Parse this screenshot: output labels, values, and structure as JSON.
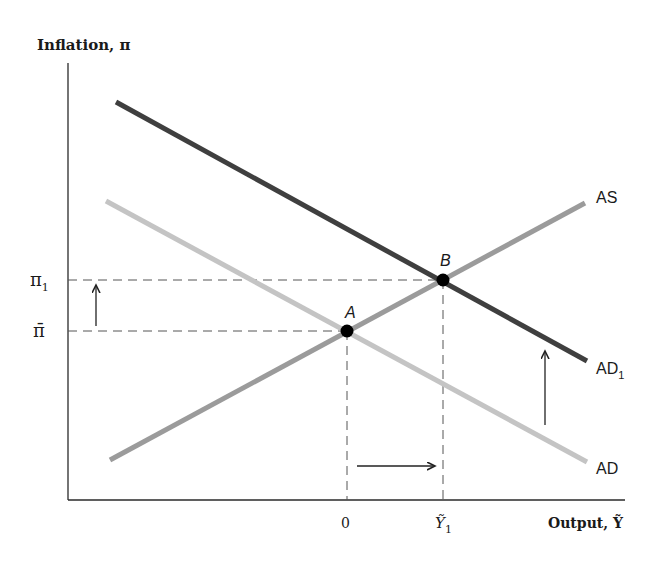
{
  "diagram": {
    "y_axis_label": "Inflation, π",
    "x_axis_label": "Output, Ỹ",
    "y_ticks": [
      {
        "label": "π",
        "sub": "1",
        "y": 280
      },
      {
        "label": "π̄",
        "sub": "",
        "y": 331
      }
    ],
    "x_ticks": [
      {
        "label": "0",
        "sub": "",
        "x": 347
      },
      {
        "label": "Ỹ",
        "sub": "1",
        "x": 443
      }
    ],
    "curves": [
      {
        "id": "AD1",
        "label": "AD",
        "sub": "1",
        "color": "#3f3f3f",
        "x1": 116,
        "y1": 102,
        "x2": 587,
        "y2": 361
      },
      {
        "id": "AD",
        "label": "AD",
        "sub": "",
        "color": "#c4c4c4",
        "x1": 106,
        "y1": 201,
        "x2": 587,
        "y2": 462
      },
      {
        "id": "AS",
        "label": "AS",
        "sub": "",
        "color": "#9b9b9b",
        "x1": 110,
        "y1": 460,
        "x2": 585,
        "y2": 203
      }
    ],
    "points": [
      {
        "label": "A",
        "x": 347,
        "y": 331
      },
      {
        "label": "B",
        "x": 443,
        "y": 280
      }
    ],
    "arrows": [
      {
        "name": "inflation-rise-arrow",
        "direction": "up",
        "x1": 96,
        "y1": 326,
        "x2": 96,
        "y2": 284
      },
      {
        "name": "ad-shift-arrow",
        "direction": "up",
        "x1": 545,
        "y1": 425,
        "x2": 545,
        "y2": 350
      },
      {
        "name": "output-rise-arrow",
        "direction": "right",
        "x1": 357,
        "y1": 466,
        "x2": 436,
        "y2": 466
      }
    ],
    "colors": {
      "axis": "#2a2a2a",
      "dashed": "#555555",
      "text": "#1a1a1a",
      "point": "#000000"
    }
  }
}
